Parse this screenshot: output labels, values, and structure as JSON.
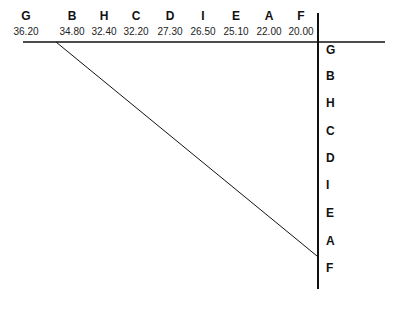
{
  "diagram": {
    "type": "comparison-ladder",
    "columns": [
      {
        "label": "G",
        "value": "36.20"
      },
      {
        "label": "B",
        "value": "34.80"
      },
      {
        "label": "H",
        "value": "32.40"
      },
      {
        "label": "C",
        "value": "32.20"
      },
      {
        "label": "D",
        "value": "27.30"
      },
      {
        "label": "I",
        "value": "26.50"
      },
      {
        "label": "E",
        "value": "25.10"
      },
      {
        "label": "A",
        "value": "22.00"
      },
      {
        "label": "F",
        "value": "20.00"
      }
    ],
    "rows": [
      {
        "label": "G"
      },
      {
        "label": "B"
      },
      {
        "label": "H"
      },
      {
        "label": "C"
      },
      {
        "label": "D"
      },
      {
        "label": "I"
      },
      {
        "label": "E"
      },
      {
        "label": "A"
      },
      {
        "label": "F"
      }
    ],
    "line_color": "#111111",
    "background": "#ffffff"
  }
}
